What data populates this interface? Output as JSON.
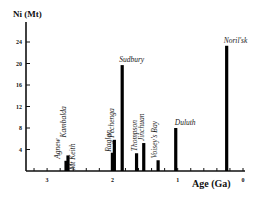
{
  "chart_data": {
    "type": "bar",
    "title": "",
    "ylabel": "Ni (Mt)",
    "xlabel": "Age (Ga)",
    "xlim": [
      3.3,
      0
    ],
    "ylim": [
      0,
      27
    ],
    "x_reversed": true,
    "x_ticks": [
      3,
      2,
      1,
      0
    ],
    "x_tick_labels": [
      "3",
      "2",
      "1",
      "0"
    ],
    "x_minor_tick_step": 0.2,
    "y_ticks": [
      4,
      8,
      12,
      16,
      20,
      24
    ],
    "y_tick_labels": [
      "4",
      "8",
      "12",
      "16",
      "20",
      "24"
    ],
    "grid": false,
    "bars": [
      {
        "name": "Agnew",
        "age": 2.71,
        "value": 1.9,
        "label": "Agnew",
        "label_rotated": true
      },
      {
        "name": "Kambalda",
        "age": 2.68,
        "value": 2.9,
        "label": "Kambalda",
        "label_rotated": true
      },
      {
        "name": "Mt Keith",
        "age": 2.68,
        "value": 0,
        "label": "Mt Keith",
        "label_rotated": true,
        "label_only": true
      },
      {
        "name": "Raglan",
        "age": 2.0,
        "value": 3.4,
        "label": "Raglan",
        "label_rotated": true
      },
      {
        "name": "Pechenga",
        "age": 1.97,
        "value": 5.8,
        "label": "Pechenga",
        "label_rotated": true
      },
      {
        "name": "Sudbury",
        "age": 1.85,
        "value": 19.7,
        "label": "Sudbury",
        "label_rotated": false
      },
      {
        "name": "Thompson",
        "age": 1.63,
        "value": 3.3,
        "label": "Thompson",
        "label_rotated": true
      },
      {
        "name": "Jinchuan",
        "age": 1.52,
        "value": 5.2,
        "label": "Jinchuan",
        "label_rotated": true
      },
      {
        "name": "Voisey's Bay",
        "age": 1.3,
        "value": 2.0,
        "label": "Voisey's Bay",
        "label_rotated": true
      },
      {
        "name": "Duluth",
        "age": 1.03,
        "value": 8.0,
        "label": "Duluth",
        "label_rotated": false
      },
      {
        "name": "Noril'sk",
        "age": 0.25,
        "value": 23.3,
        "label": "Noril'sk",
        "label_rotated": false
      }
    ]
  }
}
